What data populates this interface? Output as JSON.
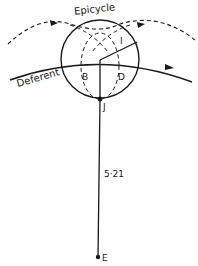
{
  "diagram": {
    "type": "epicycle-deferent",
    "labels": {
      "epicycle": "Epicycle",
      "deferent": "Deferent",
      "point_i": "I",
      "point_b": "B",
      "point_d": "D",
      "point_j": "J",
      "point_e": "E",
      "distance": "5·21"
    },
    "colors": {
      "stroke": "#1a1a1a",
      "background": "#ffffff"
    }
  }
}
